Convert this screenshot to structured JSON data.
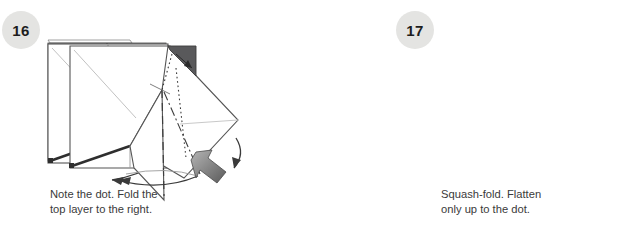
{
  "document": {
    "kind": "origami-instruction-strip",
    "background_color": "#ffffff",
    "text_color": "#3a3a3a",
    "badge_fill": "#e4e4e2",
    "paper_gray": "#8c8c8c",
    "paper_white": "#ffffff",
    "dark_flap": "#59595b",
    "arrow_gray_dark": "#6d6d6d",
    "line_color": "#4c4c4c",
    "ghost_line_color": "#b9b9b9"
  },
  "steps": [
    {
      "number": "16",
      "caption": "Note the dot. Fold the\ntop layer to the right.",
      "figure": {
        "name": "gray-square-with-x-creases",
        "paper_fill": "#8c8c8c",
        "has_dot": true,
        "has_center_dashed_line": true,
        "has_curved_right_arrow": true,
        "crease_pattern": "X-diagonals plus vertical valley fold"
      }
    },
    {
      "number": "17",
      "caption": "Squash-fold. Flatten\nonly up to the dot.",
      "figure": {
        "name": "white-square-squash-fold",
        "paper_fill": "#ffffff",
        "has_dot": true,
        "has_dotted_fold_line": true,
        "has_curved_top_arrow": true,
        "has_block_arrow_left": true,
        "has_lower_left_arrow": true
      }
    },
    {
      "number": "18",
      "caption": "Squash-fold.",
      "figure": {
        "name": "kite-squash-fold",
        "paper_fill": "#ffffff",
        "has_dark_corner_flap": true,
        "has_dash_dot_line": true,
        "has_dashed_line": true,
        "has_block_arrow": true,
        "has_curved_arrows": true
      }
    }
  ]
}
